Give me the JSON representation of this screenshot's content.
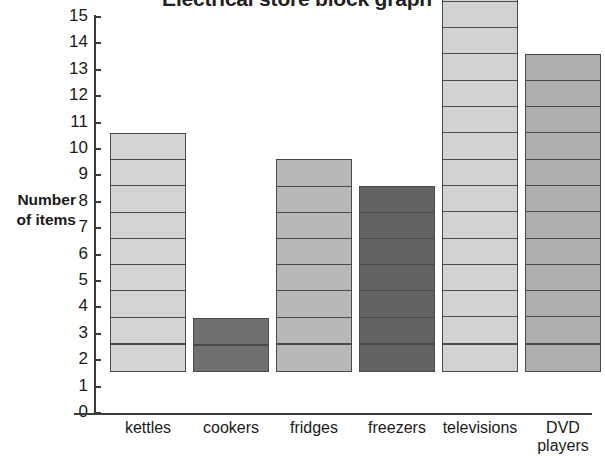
{
  "chart_data": {
    "type": "bar",
    "title": "Electrical store block graph",
    "xlabel": "",
    "ylabel": "Number of items",
    "ylim": [
      0,
      15
    ],
    "ytick_step": 1,
    "grid": false,
    "legend": "none",
    "style": "block-graph-stacked-unit-squares",
    "categories": [
      "kettles",
      "cookers",
      "fridges",
      "freezers",
      "televisions",
      "DVD players"
    ],
    "values": [
      9,
      2,
      8,
      7,
      15,
      12
    ],
    "ytick_labels": [
      "15",
      "14",
      "13",
      "12",
      "11",
      "10",
      "9",
      "8",
      "7",
      "6",
      "5",
      "4",
      "3",
      "2",
      "1",
      "0"
    ],
    "series": [
      {
        "name": "Number of items",
        "values": [
          9,
          2,
          8,
          7,
          15,
          12
        ]
      }
    ],
    "bar_colors": [
      "#d4d4d4",
      "#707070",
      "#b8b8b8",
      "#636363",
      "#d2d2d2",
      "#aeaeae"
    ],
    "block_border_color": "#4a4a4a",
    "axis_color": "#3b3b3b",
    "text_color": "#1a1a1a",
    "background": "#ffffff"
  },
  "axis": {
    "y_title_line1": "Number",
    "y_title_line2": "of items"
  },
  "x_labels": [
    {
      "line1": "kettles",
      "line2": ""
    },
    {
      "line1": "cookers",
      "line2": ""
    },
    {
      "line1": "fridges",
      "line2": ""
    },
    {
      "line1": "freezers",
      "line2": ""
    },
    {
      "line1": "televisions",
      "line2": ""
    },
    {
      "line1": "DVD",
      "line2": "players"
    }
  ]
}
